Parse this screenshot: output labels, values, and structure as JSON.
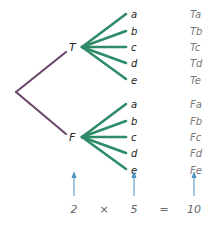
{
  "colors": {
    "root_branch": "#6b4a6b",
    "sub_branch": "#2e8b68",
    "arrow": "#4a90c0",
    "text_dark": "#222222",
    "text_light": "#777777"
  },
  "tree": {
    "root": {
      "x": 16,
      "y": 92
    },
    "first_level": [
      {
        "label": "T",
        "x": 67,
        "y": 47,
        "label_x": 72,
        "fan_x": 82
      },
      {
        "label": "F",
        "x": 67,
        "y": 137,
        "label_x": 72,
        "fan_x": 82
      }
    ],
    "leaves": [
      "a",
      "b",
      "c",
      "d",
      "e"
    ],
    "outcomes": [
      "Ta",
      "Tb",
      "Tc",
      "Td",
      "Te",
      "Fa",
      "Fb",
      "Fc",
      "Fd",
      "Fe"
    ]
  },
  "equation": {
    "terms": [
      "2",
      "×",
      "5",
      "=",
      "10"
    ]
  },
  "labels": {
    "T": "T",
    "F": "F",
    "leaf_a": "a",
    "leaf_b": "b",
    "leaf_c": "c",
    "leaf_d": "d",
    "leaf_e": "e",
    "out_0": "Ta",
    "out_1": "Tb",
    "out_2": "Tc",
    "out_3": "Td",
    "out_4": "Te",
    "out_5": "Fa",
    "out_6": "Fb",
    "out_7": "Fc",
    "out_8": "Fd",
    "out_9": "Fe",
    "eq_first": "2",
    "eq_times": "×",
    "eq_second": "5",
    "eq_equals": "=",
    "eq_result": "10"
  }
}
